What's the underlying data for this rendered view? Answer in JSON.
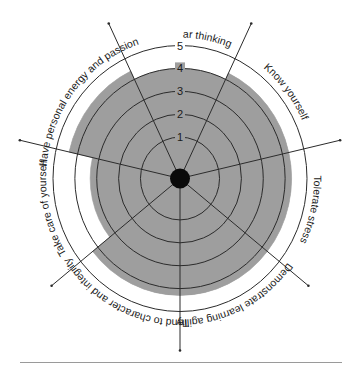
{
  "chart_data": {
    "type": "radar-sector",
    "title": "",
    "scale": {
      "min": 0,
      "max": 5,
      "ticks": [
        1,
        2,
        3,
        4,
        5
      ]
    },
    "categories": [
      "Practice clear thinking",
      "Know yourself",
      "Tolerate stress",
      "Demonstrate learning agility",
      "Tend to character and integrity",
      "Take care of yourself",
      "Have personal energy and passion"
    ],
    "values": [
      4.0,
      4.3,
      4.3,
      4.3,
      4.3,
      3.3,
      4.4
    ],
    "colors": {
      "fill": "#9e9e9e",
      "line": "#2b2b2b",
      "center": "#0a0a0a",
      "background": "#ffffff"
    },
    "grid": true,
    "legend": "none"
  },
  "labels": {
    "ticks": [
      "1",
      "2",
      "3",
      "4",
      "5"
    ]
  }
}
